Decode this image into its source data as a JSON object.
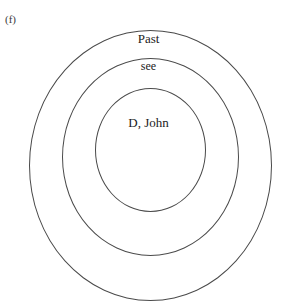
{
  "figure": {
    "enumerator": "(f)",
    "type": "concentric-circle-diagram",
    "stroke_color": "#4a4a4a",
    "text_color": "#1c1c1c",
    "background_color": "#ffffff"
  },
  "rings": [
    {
      "id": "outer",
      "label": "Past",
      "level": 1
    },
    {
      "id": "middle",
      "label": "see",
      "level": 2
    },
    {
      "id": "inner",
      "label": "D, John",
      "level": 3
    }
  ]
}
